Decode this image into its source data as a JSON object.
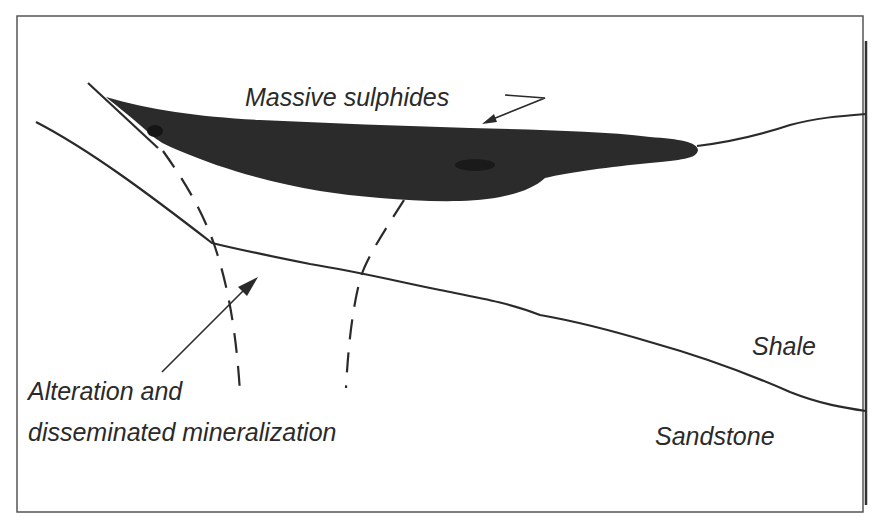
{
  "figure": {
    "type": "geological cross-section",
    "labels": {
      "massive_sulphides": "Massive sulphides",
      "alteration_line1": "Alteration and",
      "alteration_line2": "disseminated mineralization",
      "shale": "Shale",
      "sandstone": "Sandstone"
    },
    "colors": {
      "background": "#ffffff",
      "frame": "#555555",
      "line": "#2a2a2a",
      "ore_body": "#2b2b2b",
      "text": "#2a2a2a"
    }
  }
}
